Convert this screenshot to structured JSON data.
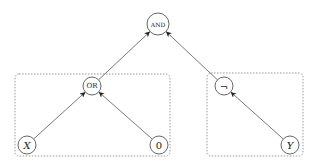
{
  "diagram": {
    "type": "expression-tree",
    "nodes": [
      {
        "id": "and",
        "label": "AND",
        "cx": 158,
        "cy": 24,
        "r": 11,
        "italic": false
      },
      {
        "id": "or",
        "label": "OR",
        "cx": 92,
        "cy": 86,
        "r": 9,
        "italic": false
      },
      {
        "id": "not",
        "label": "¬",
        "cx": 224,
        "cy": 86,
        "r": 9,
        "italic": false
      },
      {
        "id": "x",
        "label": "X",
        "cx": 27,
        "cy": 145,
        "r": 9,
        "italic": true
      },
      {
        "id": "zero",
        "label": "0",
        "cx": 159,
        "cy": 145,
        "r": 9,
        "italic": false
      },
      {
        "id": "y",
        "label": "Y",
        "cx": 290,
        "cy": 145,
        "r": 9,
        "italic": true
      }
    ],
    "edges": [
      {
        "from": "or",
        "to": "and"
      },
      {
        "from": "not",
        "to": "and"
      },
      {
        "from": "x",
        "to": "or"
      },
      {
        "from": "zero",
        "to": "or"
      },
      {
        "from": "y",
        "to": "not"
      }
    ],
    "groups": [
      {
        "id": "left-group",
        "x": 15,
        "y": 74,
        "w": 155,
        "h": 82
      },
      {
        "id": "right-group",
        "x": 207,
        "y": 73,
        "w": 96,
        "h": 83
      }
    ],
    "colors": {
      "stroke": "#555555",
      "group_stroke": "#999999",
      "text": "#222222"
    }
  }
}
